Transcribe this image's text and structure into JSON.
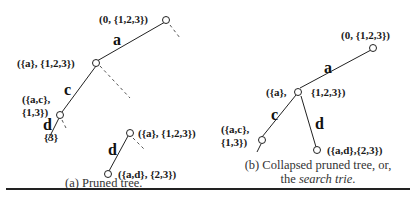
{
  "figure_a": {
    "nodes": {
      "root": "(0, {1,2,3})",
      "a": "({a}, {1,2,3})",
      "ac_line1": "({a,c},",
      "ac_line2": "{1,3})",
      "a_sub": "({a}, {1,2,3})",
      "ad": "({a,d}, {2,3})",
      "leaf3": "{3}"
    },
    "edges": {
      "a": "a",
      "c": "c",
      "d1": "d",
      "d2": "d"
    },
    "caption": "(a) Pruned tree."
  },
  "figure_b": {
    "nodes": {
      "root": "(0, {1,2,3})",
      "a_left": "({a},",
      "a_right": "{1,2,3})",
      "ac_line1": "({a,c},",
      "ac_line2": "{1,3})",
      "ad": "({a,d},{2,3})"
    },
    "edges": {
      "a": "a",
      "c": "c",
      "d": "d"
    },
    "caption_line1": "(b) Collapsed pruned tree, or,",
    "caption_line2_prefix": "the ",
    "caption_line2_em": "search trie",
    "caption_line2_suffix": "."
  }
}
